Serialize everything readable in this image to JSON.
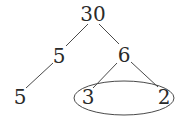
{
  "diagram": {
    "type": "factor-tree",
    "nodes": {
      "root": {
        "label": "30",
        "x": 93,
        "y": 21
      },
      "left": {
        "label": "5",
        "x": 59,
        "y": 63
      },
      "right": {
        "label": "6",
        "x": 124,
        "y": 62
      },
      "left_leaf": {
        "label": "5",
        "x": 20,
        "y": 104
      },
      "right_left_leaf": {
        "label": "3",
        "x": 88,
        "y": 104
      },
      "right_right_leaf": {
        "label": "2",
        "x": 164,
        "y": 104
      }
    },
    "edges": [
      {
        "from": "root",
        "to": "left"
      },
      {
        "from": "root",
        "to": "right"
      },
      {
        "from": "left",
        "to": "left_leaf"
      },
      {
        "from": "right",
        "to": "right_left_leaf"
      },
      {
        "from": "right",
        "to": "right_right_leaf"
      }
    ],
    "highlight": {
      "shape": "ellipse",
      "encloses": [
        "right_left_leaf",
        "right_right_leaf"
      ]
    },
    "colors": {
      "text": "#2a2a2a",
      "line": "#4a4a4a",
      "background": "#ffffff"
    }
  }
}
